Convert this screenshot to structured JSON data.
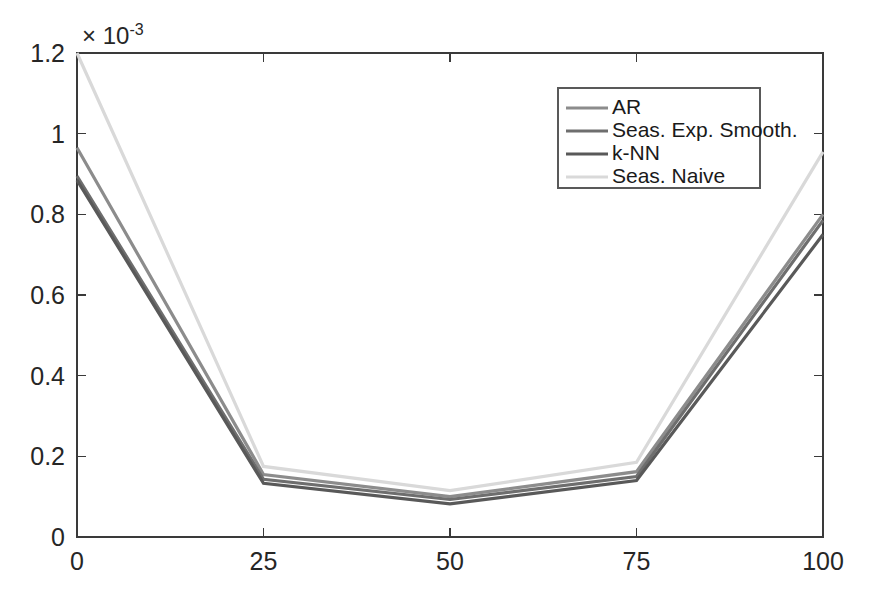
{
  "chart_data": {
    "type": "line",
    "title": "",
    "subtitle": "",
    "xlabel": "",
    "ylabel": "",
    "x": [
      0,
      25,
      50,
      75,
      100
    ],
    "xtick_labels": [
      "0",
      "25",
      "50",
      "75",
      "100"
    ],
    "xlim": [
      0,
      100
    ],
    "ytick_labels": [
      "0",
      "0.2",
      "0.4",
      "0.6",
      "0.8",
      "1",
      "1.2"
    ],
    "ytick_values": [
      0,
      0.2,
      0.4,
      0.6,
      0.8,
      1,
      1.2
    ],
    "ylim": [
      0,
      1.2
    ],
    "y_axis_multiplier": "× 10",
    "y_axis_exponent": "-3",
    "grid": false,
    "legend_position": "top-right-inside",
    "background_color": "#ffffff",
    "axes_color": "#3a3a3a",
    "series": [
      {
        "name": "AR",
        "color": "#8c8c8c",
        "values": [
          0.965,
          0.155,
          0.1,
          0.162,
          0.8
        ]
      },
      {
        "name": "Seas. Exp. Smooth.",
        "color": "#6e6e6e",
        "values": [
          0.895,
          0.143,
          0.093,
          0.15,
          0.785
        ]
      },
      {
        "name": "k-NN",
        "color": "#595959",
        "values": [
          0.885,
          0.133,
          0.082,
          0.14,
          0.75
        ]
      },
      {
        "name": "Seas. Naive",
        "color": "#d9d9d9",
        "values": [
          1.2,
          0.175,
          0.115,
          0.185,
          0.955
        ]
      }
    ]
  }
}
